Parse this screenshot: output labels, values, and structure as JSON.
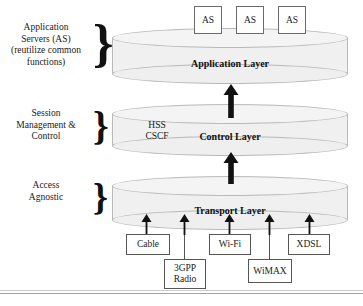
{
  "diagram": {
    "side_labels": [
      {
        "id": "application-servers",
        "text": "Application\nServers (AS)\n(reutilize common\nfunctions)"
      },
      {
        "id": "session-management",
        "text": "Session\nManagement &\nControl"
      },
      {
        "id": "access-agnostic",
        "text": "Access\nAgnostic"
      }
    ],
    "layers": [
      {
        "id": "application-layer",
        "label": "Application Layer",
        "sublabel": ""
      },
      {
        "id": "control-layer",
        "label": "Control Layer",
        "sublabel": "HSS\nCSCF"
      },
      {
        "id": "transport-layer",
        "label": "Transport Layer",
        "sublabel": ""
      }
    ],
    "application_servers": [
      {
        "label": "AS"
      },
      {
        "label": "AS"
      },
      {
        "label": "AS"
      }
    ],
    "access_networks": [
      {
        "label": "Cable"
      },
      {
        "label": "3GPP\nRadio"
      },
      {
        "label": "Wi-Fi"
      },
      {
        "label": "WiMAX"
      },
      {
        "label": "XDSL"
      }
    ],
    "colors": {
      "cylinder_fill": "#f0f0f0",
      "cylinder_stroke": "#b9b9b9",
      "box_stroke": "#555555",
      "arrow": "#111111",
      "text": "#1a1a1a"
    }
  }
}
